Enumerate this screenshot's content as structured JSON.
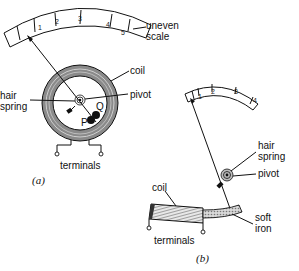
{
  "figure_a": {
    "caption": "(a)",
    "scale_ticks": [
      "1",
      "2",
      "3",
      "4",
      "5"
    ],
    "labels": {
      "scale": [
        "uneven",
        "scale"
      ],
      "coil": "coil",
      "pivot": "pivot",
      "hair_spring": [
        "hair",
        "spring"
      ],
      "p": "P",
      "q": "Q",
      "terminals": "terminals"
    }
  },
  "figure_b": {
    "caption": "(b)",
    "scale_ticks": [
      "1",
      "2",
      "3",
      "4",
      "5"
    ],
    "labels": {
      "hair_spring": [
        "hair",
        "spring"
      ],
      "pivot": "pivot",
      "coil": "coil",
      "soft_iron": [
        "soft",
        "iron"
      ],
      "terminals": "terminals"
    }
  },
  "colors": {
    "ink": "#111111",
    "coil_fill": "#8a8a8a",
    "coil_winding": "#cfcfcf",
    "background": "#ffffff"
  }
}
